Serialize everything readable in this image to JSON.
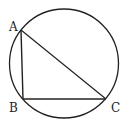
{
  "diagram": {
    "type": "geometry",
    "circle": {
      "cx": 64,
      "cy": 63.5,
      "r": 54.5
    },
    "points": {
      "A": {
        "label": "A",
        "x": 21,
        "y": 30,
        "label_x": 9,
        "label_y": 31
      },
      "B": {
        "label": "B",
        "x": 23,
        "y": 99,
        "label_x": 9,
        "label_y": 112
      },
      "C": {
        "label": "C",
        "x": 106,
        "y": 99,
        "label_x": 111,
        "label_y": 112
      }
    },
    "stroke_color": "#222222"
  }
}
